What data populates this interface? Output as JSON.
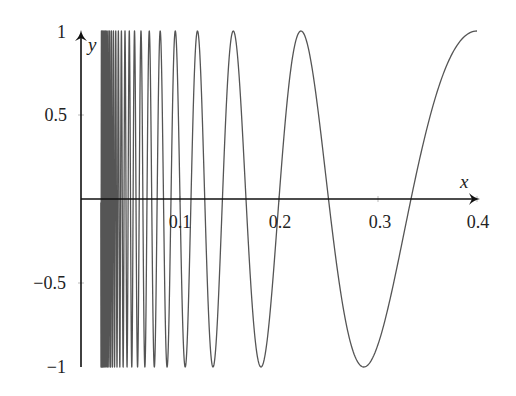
{
  "chart_data": {
    "type": "line",
    "title": "",
    "xlabel": "x",
    "ylabel": "y",
    "function": "y = sin(π/x)",
    "domain": [
      0.02,
      0.4
    ],
    "xlim": [
      0,
      0.4
    ],
    "ylim": [
      -1,
      1
    ],
    "grid": false,
    "legend": null,
    "xticks": [
      {
        "value": 0.1,
        "label": "0.1"
      },
      {
        "value": 0.2,
        "label": "0.2"
      },
      {
        "value": 0.3,
        "label": "0.3"
      },
      {
        "value": 0.4,
        "label": "0.4"
      }
    ],
    "yticks": [
      {
        "value": 1,
        "label": "1"
      },
      {
        "value": 0.5,
        "label": "0.5"
      },
      {
        "value": -0.5,
        "label": "−0.5"
      },
      {
        "value": -1,
        "label": "−1"
      }
    ],
    "series": [
      {
        "name": "sin(π/x)",
        "color": "#555555",
        "x": [
          0.4,
          0.3333,
          0.2857,
          0.25,
          0.2222,
          0.2,
          0.1818,
          0.1667,
          0.1538,
          0.1429,
          0.1333,
          0.125,
          0.1176,
          0.1111,
          0.1053,
          0.1
        ],
        "y": [
          1,
          0,
          -1,
          0,
          1,
          0,
          -1,
          0,
          1,
          0,
          -1,
          0,
          1,
          0,
          -1,
          0
        ]
      }
    ],
    "colors": {
      "axis": "#111111",
      "curve": "#555555",
      "background": "#ffffff"
    }
  }
}
